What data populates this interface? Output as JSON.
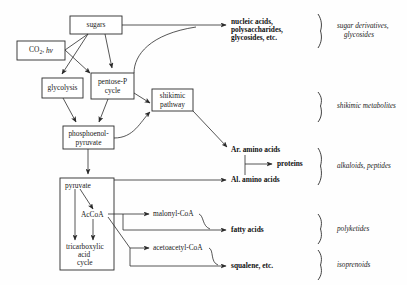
{
  "diagram": {
    "stroke_color": "#2b2b2b",
    "background_color": "#fefefe",
    "boxes": [
      {
        "id": "sugars",
        "label": "sugars",
        "x": 70,
        "y": 16,
        "w": 52,
        "h": 18
      },
      {
        "id": "co2",
        "label": "CO2, hv",
        "label_main": "CO",
        "label_sub": "2",
        "label_rest": ", h",
        "label_ital": "v",
        "x": 17,
        "y": 41,
        "w": 48,
        "h": 19
      },
      {
        "id": "glycolysis",
        "label": "glycolysis",
        "x": 42,
        "y": 78,
        "w": 41,
        "h": 20
      },
      {
        "id": "pentose",
        "label_line1": "pentose-P",
        "label_line2": "cycle",
        "x": 91,
        "y": 73,
        "w": 43,
        "h": 26
      },
      {
        "id": "shikimic",
        "label_line1": "shikimic",
        "label_line2": "pathway",
        "x": 152,
        "y": 89,
        "w": 41,
        "h": 22
      },
      {
        "id": "pep",
        "label_line1": "phosphoenol-",
        "label_line2": "pyruvate",
        "x": 63,
        "y": 126,
        "w": 51,
        "h": 23
      },
      {
        "id": "tcabox",
        "label": "",
        "x": 60,
        "y": 178,
        "w": 54,
        "h": 92
      }
    ],
    "inner_labels": [
      {
        "id": "pyruvate",
        "label": "pyruvate",
        "x": 65,
        "y": 186
      },
      {
        "id": "accoa",
        "label": "AcCoA",
        "x": 81,
        "y": 215
      },
      {
        "id": "tca-line1",
        "label": "tricarboxylic",
        "x": 66,
        "y": 247
      },
      {
        "id": "tca-line2",
        "label": "acid",
        "x": 78,
        "y": 255
      },
      {
        "id": "tca-line3",
        "label": "cycle",
        "x": 77,
        "y": 263
      }
    ],
    "products": [
      {
        "id": "nucleic",
        "lines": [
          "nucleic acids,",
          "polysaccharides,",
          "glycosides, etc."
        ],
        "x": 230,
        "y": 22
      },
      {
        "id": "ar-amino",
        "lines": [
          "Ar. amino acids"
        ],
        "x": 230,
        "y": 150
      },
      {
        "id": "proteins",
        "lines": [
          "proteins"
        ],
        "x": 277,
        "y": 164
      },
      {
        "id": "al-amino",
        "lines": [
          "Al. amino acids"
        ],
        "x": 230,
        "y": 180
      },
      {
        "id": "malonyl",
        "lines": [
          "malonyl-CoA"
        ],
        "x": 153,
        "y": 214
      },
      {
        "id": "fatty-acids",
        "lines": [
          "fatty acids"
        ],
        "x": 230,
        "y": 230
      },
      {
        "id": "acetoacetyl",
        "lines": [
          "acetoacetyl-CoA"
        ],
        "x": 153,
        "y": 250
      },
      {
        "id": "squalene",
        "lines": [
          "squalene, etc."
        ],
        "x": 230,
        "y": 266
      }
    ],
    "classes": [
      {
        "id": "sugar-derivatives",
        "lines": [
          "sugar derivatives,",
          "glycosides"
        ],
        "x": 337,
        "y": 26,
        "brace_top": 14,
        "brace_bottom": 48
      },
      {
        "id": "shikimic-metabolites",
        "lines": [
          "shikimic metabolites"
        ],
        "x": 337,
        "y": 106,
        "brace_top": 92,
        "brace_bottom": 122
      },
      {
        "id": "alkaloids-peptides",
        "lines": [
          "alkaloids, peptides"
        ],
        "x": 337,
        "y": 165,
        "brace_top": 148,
        "brace_bottom": 185
      },
      {
        "id": "polyketides",
        "lines": [
          "polyketides"
        ],
        "x": 337,
        "y": 228,
        "brace_top": 214,
        "brace_bottom": 244
      },
      {
        "id": "isoprenoids",
        "lines": [
          "isoprenoids"
        ],
        "x": 337,
        "y": 265,
        "brace_top": 250,
        "brace_bottom": 280
      }
    ]
  }
}
